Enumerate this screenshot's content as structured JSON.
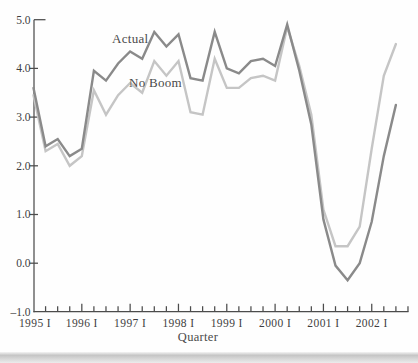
{
  "figure": {
    "x_axis_title": "Quarter",
    "series_label_actual": "Actual",
    "series_label_no_boom": "No Boom"
  },
  "colors": {
    "actual_line": "#8a8a8a",
    "no_boom_line": "#c5c5c5",
    "axis": "#4c4c4c",
    "text": "#3e3e3e",
    "background": "#fefefe",
    "page_edge_band": "#cccccc"
  },
  "chart_data": {
    "type": "line",
    "title": "",
    "xlabel": "Quarter",
    "ylabel": "",
    "frequency": "quarterly",
    "x_start": "1995 Q1",
    "x_end": "2002 Q3",
    "ylim": [
      -1.0,
      5.0
    ],
    "grid": false,
    "legend_position": "inline-labels",
    "y_ticks": [
      {
        "v": 5.0,
        "label": "5.0"
      },
      {
        "v": 4.0,
        "label": "4.0"
      },
      {
        "v": 3.0,
        "label": "3.0"
      },
      {
        "v": 2.0,
        "label": "2.0"
      },
      {
        "v": 1.0,
        "label": "1.0"
      },
      {
        "v": 0.0,
        "label": "0.0"
      },
      {
        "v": -1.0,
        "label": "–1.0"
      }
    ],
    "x_ticks_total_quarters": 31,
    "x_tick_labels": [
      {
        "q": 0,
        "label": "1995 I"
      },
      {
        "q": 4,
        "label": "1996 I"
      },
      {
        "q": 8,
        "label": "1997 I"
      },
      {
        "q": 12,
        "label": "1998 I"
      },
      {
        "q": 16,
        "label": "1999 I"
      },
      {
        "q": 20,
        "label": "2000 I"
      },
      {
        "q": 24,
        "label": "2001 I"
      },
      {
        "q": 28,
        "label": "2002 I"
      }
    ],
    "series": [
      {
        "name": "Actual",
        "color": "#8a8a8a",
        "values": [
          3.6,
          2.4,
          2.55,
          2.2,
          2.35,
          3.95,
          3.75,
          4.1,
          4.35,
          4.2,
          4.75,
          4.45,
          4.7,
          3.8,
          3.75,
          4.75,
          4.0,
          3.9,
          4.15,
          4.2,
          4.05,
          4.9,
          3.95,
          2.85,
          0.9,
          -0.05,
          -0.35,
          0.0,
          0.85,
          2.2,
          3.25
        ]
      },
      {
        "name": "No Boom",
        "color": "#c5c5c5",
        "values": [
          3.45,
          2.3,
          2.45,
          2.0,
          2.2,
          3.55,
          3.05,
          3.45,
          3.7,
          3.5,
          4.15,
          3.85,
          4.15,
          3.1,
          3.05,
          4.2,
          3.6,
          3.6,
          3.8,
          3.85,
          3.75,
          4.85,
          4.05,
          3.05,
          1.1,
          0.35,
          0.35,
          0.75,
          2.35,
          3.85,
          4.5
        ]
      }
    ]
  }
}
